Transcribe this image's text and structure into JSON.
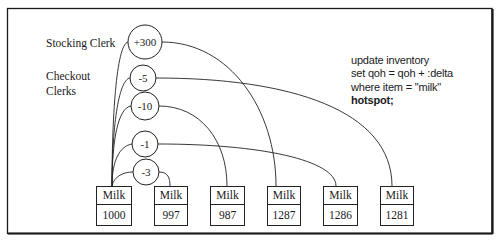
{
  "labels": {
    "stocking_clerk": "Stocking Clerk",
    "checkout_line1": "Checkout",
    "checkout_line2": "Clerks"
  },
  "transactions": [
    {
      "delta": "+300",
      "role": "stocking",
      "target_version": 3
    },
    {
      "delta": "-5",
      "role": "checkout",
      "target_version": 5
    },
    {
      "delta": "-10",
      "role": "checkout",
      "target_version": 2
    },
    {
      "delta": "-1",
      "role": "checkout",
      "target_version": 4
    },
    {
      "delta": "-3",
      "role": "checkout",
      "target_version": 1
    }
  ],
  "records": [
    {
      "item": "Milk",
      "qoh": "1000"
    },
    {
      "item": "Milk",
      "qoh": "997"
    },
    {
      "item": "Milk",
      "qoh": "987"
    },
    {
      "item": "Milk",
      "qoh": "1287"
    },
    {
      "item": "Milk",
      "qoh": "1286"
    },
    {
      "item": "Milk",
      "qoh": "1281"
    }
  ],
  "sql": {
    "line1": "update inventory",
    "line2": "set qoh = qoh + :delta",
    "line3": "where item = \"milk\"",
    "line4": "hotspot;"
  },
  "colors": {
    "line": "#222222",
    "frame": "#1a1a1a",
    "background": "#ffffff"
  }
}
